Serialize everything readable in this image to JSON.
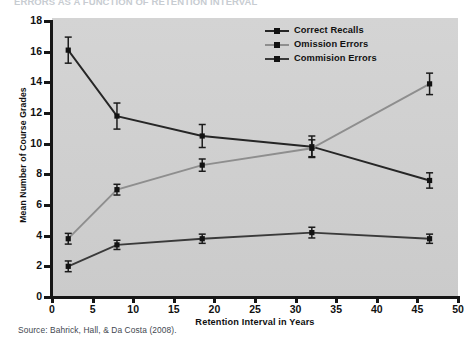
{
  "figure": {
    "cut_title": "ERRORS AS A FUNCTION OF RETENTION INTERVAL",
    "source": "Source: Bahrick, Hall, & Da Costa (2008)."
  },
  "chart_data": {
    "type": "line",
    "title": "",
    "xlabel": "Retention Interval in Years",
    "ylabel": "Mean Number of Course Grades",
    "xlim": [
      0,
      50
    ],
    "ylim": [
      0,
      18
    ],
    "xticks": [
      0,
      5,
      10,
      15,
      20,
      25,
      30,
      35,
      40,
      45,
      50
    ],
    "yticks": [
      0,
      2,
      4,
      6,
      8,
      10,
      12,
      14,
      16,
      18
    ],
    "grid": false,
    "legend_position": "top-right",
    "panel_color": "#d2d2d2",
    "x": [
      2,
      8,
      18.5,
      32,
      46.5
    ],
    "series": [
      {
        "name": "Correct Recalls",
        "color": "#262626",
        "marker": "square",
        "values": [
          16.1,
          11.8,
          10.5,
          9.8,
          7.6
        ],
        "errors": [
          0.85,
          0.85,
          0.75,
          0.7,
          0.5
        ]
      },
      {
        "name": "Omission Errors",
        "color": "#8e8e8e",
        "marker": "square",
        "values": [
          3.8,
          7.0,
          8.6,
          9.7,
          13.9
        ],
        "errors": [
          0.35,
          0.35,
          0.4,
          0.55,
          0.7
        ]
      },
      {
        "name": "Commision Errors",
        "color": "#3a3a3a",
        "marker": "square",
        "values": [
          2.0,
          3.4,
          3.8,
          4.2,
          3.8
        ],
        "errors": [
          0.35,
          0.3,
          0.3,
          0.35,
          0.3
        ]
      }
    ]
  }
}
